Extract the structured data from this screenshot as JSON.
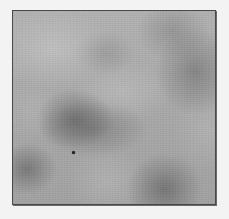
{
  "image": {
    "description": "Grayscale cloud / noise texture inside a thin dark square frame",
    "frame": {
      "x": 12,
      "y": 10,
      "width": 202,
      "height": 193,
      "border_color": "#4a4a4a"
    },
    "base_color": "#a9a9a9",
    "background_color": "#f3f3f3",
    "speck": {
      "x": 73,
      "y": 152,
      "size": 3,
      "color": "#1e1e1e"
    }
  }
}
